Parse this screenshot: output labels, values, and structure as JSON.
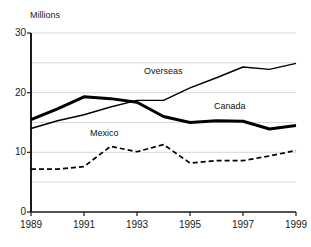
{
  "chart_data": {
    "type": "line",
    "title": "",
    "subtitle": "",
    "ylabel": "Millions",
    "xlabel": "",
    "x": [
      1989,
      1990,
      1991,
      1992,
      1993,
      1994,
      1995,
      1996,
      1997,
      1998,
      1999
    ],
    "xlim": [
      1989,
      1999
    ],
    "ylim": [
      0,
      30
    ],
    "yticks": [
      0,
      10,
      20,
      30
    ],
    "ytick_labels": [
      "0",
      "10",
      "20",
      "30"
    ],
    "xticks": [
      1989,
      1991,
      1993,
      1995,
      1997,
      1999
    ],
    "xtick_labels": [
      "1989",
      "1991",
      "1993",
      "1995",
      "1997",
      "1999"
    ],
    "grid": true,
    "grid_interval": 5,
    "legend": "inline-annotations",
    "series": [
      {
        "name": "Canada",
        "style": "solid-thick",
        "color": "#000000",
        "values": [
          15.5,
          17.3,
          19.3,
          19.0,
          18.4,
          16.0,
          15.0,
          15.3,
          15.2,
          13.9,
          14.5
        ]
      },
      {
        "name": "Overseas",
        "style": "solid-thin",
        "color": "#000000",
        "values": [
          14.0,
          15.3,
          16.3,
          17.6,
          18.7,
          18.7,
          20.8,
          22.5,
          24.3,
          23.9,
          24.9
        ]
      },
      {
        "name": "Mexico",
        "style": "dashed",
        "color": "#000000",
        "values": [
          7.2,
          7.2,
          7.6,
          11.0,
          10.1,
          11.3,
          8.2,
          8.6,
          8.6,
          9.4,
          10.3
        ]
      }
    ],
    "annotations": [
      {
        "text": "Overseas",
        "x": 1993,
        "y": 22.0
      },
      {
        "text": "Canada",
        "x": 1996.5,
        "y": 17.6
      },
      {
        "text": "Mexico",
        "x": 1991.5,
        "y": 12.6
      }
    ]
  },
  "labels": {
    "units": "Millions",
    "overseas": "Overseas",
    "canada": "Canada",
    "mexico": "Mexico"
  },
  "colors": {
    "axis": "#1a1a1a",
    "grid": "#d9d9d9",
    "line": "#000000",
    "background": "#ffffff"
  }
}
